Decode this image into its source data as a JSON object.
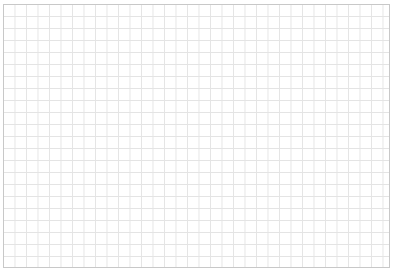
{
  "canvas": {
    "type": "empty-grid",
    "grid_color": "#e4e4e4",
    "border_color": "#c8c8c8",
    "background_color": "#ffffff"
  }
}
